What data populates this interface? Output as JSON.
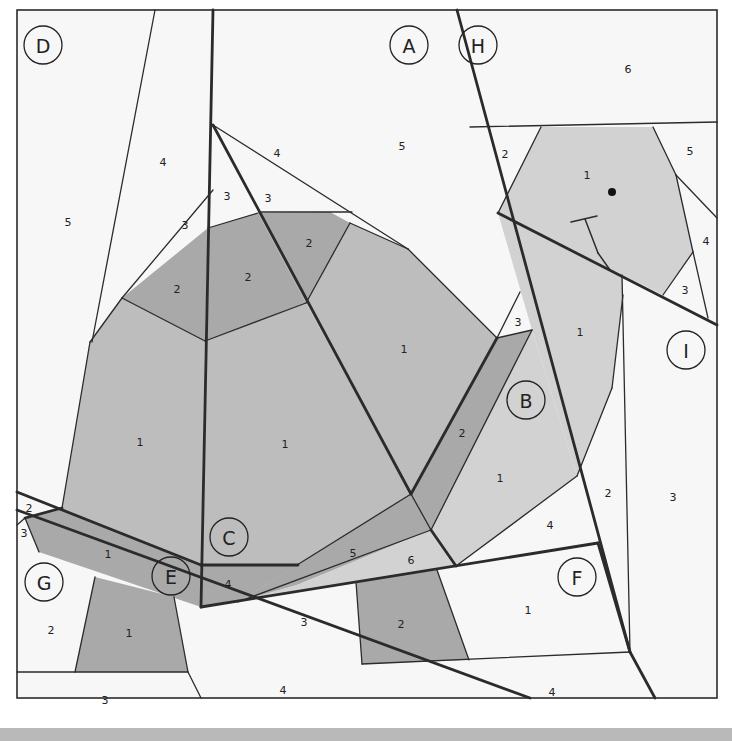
{
  "diagram": {
    "frame": {
      "x": 17,
      "y": 10,
      "w": 700,
      "h": 688
    },
    "colors": {
      "background": "#f7f7f7",
      "dark_fill": "#a9a9a9",
      "mid_fill": "#bdbdbd",
      "light_fill": "#d2d2d2",
      "white_fill": "#f5f5f5",
      "line": "#2b2b2b",
      "bottom_bar": "#b9b9b9"
    },
    "shapes": [
      {
        "id": "C1-left",
        "fill": "mid",
        "points": "90,342 122,298 205,341 201,565 62,508"
      },
      {
        "id": "C1-right",
        "fill": "mid",
        "points": "205,341 306,303 411,494 298,565 201,565"
      },
      {
        "id": "A1",
        "fill": "mid",
        "points": "306,303 350,223 408,249 497,338 411,494"
      },
      {
        "id": "C2-left",
        "fill": "dark",
        "points": "122,298 208,228 205,341"
      },
      {
        "id": "C2-mid",
        "fill": "dark",
        "points": "208,228 258,213 306,303 205,341"
      },
      {
        "id": "A2",
        "fill": "dark",
        "points": "258,213 330,212 350,223 306,303"
      },
      {
        "id": "B2",
        "fill": "dark",
        "points": "497,338 532,330 431,530 411,494"
      },
      {
        "id": "B1",
        "fill": "light",
        "points": "532,330 577,476 456,566 431,530"
      },
      {
        "id": "C5",
        "fill": "dark",
        "points": "411,494 431,530 297,585 238,602"
      },
      {
        "id": "C4",
        "fill": "dark",
        "points": "201,565 298,565 238,602 201,607"
      },
      {
        "id": "C6",
        "fill": "light",
        "points": "431,530 456,566 240,601 297,585"
      },
      {
        "id": "E1",
        "fill": "dark",
        "points": "25,518 62,508 201,565 201,607 39,552"
      },
      {
        "id": "G1",
        "fill": "dark",
        "points": "95,577 174,597 188,672 75,672"
      },
      {
        "id": "F2",
        "fill": "dark",
        "points": "356,582 437,570 469,660 362,664"
      },
      {
        "id": "H1",
        "fill": "light",
        "points": "498,213 541,127 653,127 676,175 693,252 663,295 498,213"
      },
      {
        "id": "I1",
        "fill": "light",
        "points": "498,213 622,275 623,295 612,388 577,476 532,330"
      }
    ],
    "thick_lines": [
      "213,10 201,607",
      "213,125 411,494",
      "411,494 497,338",
      "431,530 456,566",
      "17,492 201,565",
      "17,510 530,698",
      "201,607 598,543",
      "457,10 630,652",
      "630,652 655,698",
      "498,213 717,325",
      "62,508 25,518",
      "201,565 298,565",
      "598,543 630,652"
    ],
    "thin_lines": [
      "155,10 92,342",
      "213,125 408,249",
      "122,298 213,190",
      "261,212 352,212",
      "208,228 258,213",
      "350,223 408,249",
      "122,298 205,341",
      "205,341 306,303",
      "306,303 350,223",
      "90,342 122,298",
      "62,508 90,342",
      "408,249 497,338",
      "497,338 520,292",
      "497,338 532,330",
      "532,330 431,530",
      "411,494 431,530",
      "431,530 238,602",
      "411,494 297,565",
      "577,476 456,566",
      "612,388 577,476",
      "623,295 612,388",
      "622,275 630,652",
      "470,127 717,122",
      "498,213 541,127",
      "653,127 676,175",
      "676,175 717,218",
      "676,175 693,252",
      "693,252 708,318",
      "693,252 663,295",
      "95,577 75,672",
      "174,597 188,672",
      "17,672 188,672",
      "188,672 201,698",
      "356,582 362,664",
      "437,570 469,660",
      "362,664 630,652",
      "25,518 39,552",
      "17,525 25,518"
    ],
    "eye": {
      "cx": 612,
      "cy": 192,
      "r": 4
    },
    "mouth_lines": [
      "571,222 597,216",
      "585,219 598,253",
      "598,253 610,270"
    ],
    "piece_labels": [
      {
        "t": "4",
        "x": 163,
        "y": 162
      },
      {
        "t": "5",
        "x": 68,
        "y": 222
      },
      {
        "t": "3",
        "x": 185,
        "y": 225
      },
      {
        "t": "4",
        "x": 277,
        "y": 153
      },
      {
        "t": "5",
        "x": 402,
        "y": 146
      },
      {
        "t": "3",
        "x": 227,
        "y": 196
      },
      {
        "t": "3",
        "x": 268,
        "y": 198
      },
      {
        "t": "2",
        "x": 309,
        "y": 243
      },
      {
        "t": "2",
        "x": 248,
        "y": 277
      },
      {
        "t": "2",
        "x": 177,
        "y": 289
      },
      {
        "t": "1",
        "x": 404,
        "y": 349
      },
      {
        "t": "1",
        "x": 140,
        "y": 442
      },
      {
        "t": "1",
        "x": 285,
        "y": 444
      },
      {
        "t": "6",
        "x": 628,
        "y": 69
      },
      {
        "t": "2",
        "x": 505,
        "y": 154
      },
      {
        "t": "1",
        "x": 587,
        "y": 175
      },
      {
        "t": "5",
        "x": 690,
        "y": 151
      },
      {
        "t": "4",
        "x": 706,
        "y": 241
      },
      {
        "t": "3",
        "x": 685,
        "y": 290
      },
      {
        "t": "3",
        "x": 518,
        "y": 322
      },
      {
        "t": "1",
        "x": 580,
        "y": 332
      },
      {
        "t": "2",
        "x": 462,
        "y": 433
      },
      {
        "t": "1",
        "x": 500,
        "y": 478
      },
      {
        "t": "2",
        "x": 608,
        "y": 493
      },
      {
        "t": "3",
        "x": 673,
        "y": 497
      },
      {
        "t": "4",
        "x": 550,
        "y": 525
      },
      {
        "t": "5",
        "x": 353,
        "y": 553
      },
      {
        "t": "6",
        "x": 411,
        "y": 560
      },
      {
        "t": "4",
        "x": 228,
        "y": 584
      },
      {
        "t": "2",
        "x": 29,
        "y": 508
      },
      {
        "t": "3",
        "x": 24,
        "y": 533
      },
      {
        "t": "1",
        "x": 108,
        "y": 554
      },
      {
        "t": "2",
        "x": 51,
        "y": 630
      },
      {
        "t": "1",
        "x": 129,
        "y": 633
      },
      {
        "t": "3",
        "x": 105,
        "y": 700
      },
      {
        "t": "3",
        "x": 304,
        "y": 622
      },
      {
        "t": "2",
        "x": 401,
        "y": 624
      },
      {
        "t": "1",
        "x": 528,
        "y": 610
      },
      {
        "t": "4",
        "x": 283,
        "y": 690
      },
      {
        "t": "4",
        "x": 552,
        "y": 692
      }
    ],
    "section_labels": [
      {
        "t": "D",
        "x": 43,
        "y": 45
      },
      {
        "t": "A",
        "x": 409,
        "y": 45
      },
      {
        "t": "H",
        "x": 478,
        "y": 45
      },
      {
        "t": "B",
        "x": 526,
        "y": 400
      },
      {
        "t": "I",
        "x": 686,
        "y": 350
      },
      {
        "t": "C",
        "x": 229,
        "y": 537
      },
      {
        "t": "E",
        "x": 171,
        "y": 576
      },
      {
        "t": "G",
        "x": 44,
        "y": 582
      },
      {
        "t": "F",
        "x": 577,
        "y": 577
      }
    ]
  }
}
